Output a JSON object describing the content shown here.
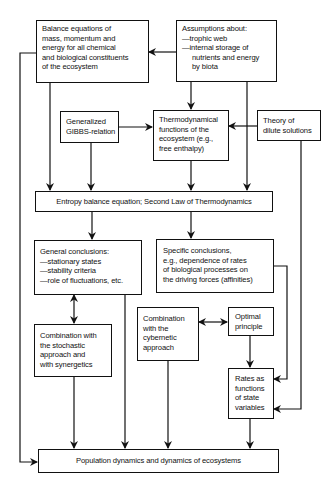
{
  "diagram": {
    "nodes": {
      "balance": {
        "lines": [
          "Balance equations of",
          "mass, momentum and",
          "energy for all chemical",
          "and biological constituents",
          "of the ecosystem"
        ]
      },
      "assumptions": {
        "lines": [
          "Assumptions about:",
          "—trophic web",
          "—internal storage of",
          "nutrients and energy",
          "by biota"
        ]
      },
      "gibbs": {
        "lines": [
          "Generalized",
          "GIBBS-relation"
        ]
      },
      "thermo": {
        "lines": [
          "Thermodynamical",
          "functions of the",
          "ecosystem (e.g.,",
          "free enthalpy)"
        ]
      },
      "dilute": {
        "lines": [
          "Theory of",
          "dilute solutions"
        ]
      },
      "entropy": {
        "label": "Entropy balance equation; Second Law of Thermodynamics"
      },
      "general": {
        "lines": [
          "General conclusions:",
          "—stationary states",
          "—stability criteria",
          "—role of fluctuations, etc."
        ]
      },
      "specific": {
        "lines": [
          "Specific conclusions,",
          "e.g., dependence of rates",
          "of biological processes on",
          "the driving forces (affinities)"
        ]
      },
      "stochastic": {
        "lines": [
          "Combination with",
          "the stochastic",
          "approach and",
          "with synergetics"
        ]
      },
      "cybernetic": {
        "lines": [
          "Combination",
          "with the",
          "cybernetic",
          "approach"
        ]
      },
      "optimal": {
        "lines": [
          "Optimal",
          "principle"
        ]
      },
      "rates": {
        "lines": [
          "Rates as",
          "functions",
          "of state",
          "variables"
        ]
      },
      "population": {
        "label": "Population dynamics and dynamics of ecosystems"
      }
    },
    "edges": [
      {
        "from": "assumptions",
        "to": "balance"
      },
      {
        "from": "assumptions",
        "to": "thermo"
      },
      {
        "from": "assumptions",
        "to": "entropy"
      },
      {
        "from": "balance",
        "to": "entropy"
      },
      {
        "from": "balance",
        "to": "population"
      },
      {
        "from": "gibbs",
        "to": "thermo"
      },
      {
        "from": "gibbs",
        "to": "entropy"
      },
      {
        "from": "dilute",
        "to": "thermo"
      },
      {
        "from": "dilute",
        "to": "rates"
      },
      {
        "from": "thermo",
        "to": "entropy"
      },
      {
        "from": "entropy",
        "to": "general"
      },
      {
        "from": "entropy",
        "to": "specific"
      },
      {
        "from": "general",
        "to": "stochastic",
        "bidirectional": true
      },
      {
        "from": "general",
        "to": "population"
      },
      {
        "from": "specific",
        "to": "rates"
      },
      {
        "from": "cybernetic",
        "to": "optimal",
        "bidirectional": true
      },
      {
        "from": "optimal",
        "to": "rates"
      },
      {
        "from": "stochastic",
        "to": "population"
      },
      {
        "from": "cybernetic",
        "to": "population"
      },
      {
        "from": "rates",
        "to": "population"
      }
    ],
    "colors": {
      "line": "#111111",
      "background": "#ffffff"
    }
  }
}
